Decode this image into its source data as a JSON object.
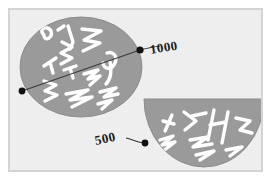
{
  "diagram": {
    "background_color": "#eeeeee",
    "frame_border_color": "#d4d4d4",
    "shape_fill_color": "#9a9a9a",
    "shape_stroke_color": "#8a8a8a",
    "scribble_color": "#ffffff",
    "marker_color": "#111111",
    "leader_line_color": "#333333",
    "shapes": [
      {
        "name": "ellipse-upper-left",
        "kind": "ellipse",
        "cx": 81,
        "cy": 67,
        "rx": 61,
        "ry": 50
      },
      {
        "name": "half-ellipse-lower-right",
        "kind": "half-ellipse",
        "cx": 204,
        "cy": 99,
        "rx": 60,
        "ry": 68
      }
    ],
    "chord": {
      "name": "chord-line",
      "x1": 22,
      "y1": 91,
      "x2": 140,
      "y2": 50
    },
    "markers": [
      {
        "name": "marker-left",
        "cx": 22,
        "cy": 91,
        "r": 3.4
      },
      {
        "name": "marker-top-right",
        "cx": 140,
        "cy": 50,
        "r": 3.6
      },
      {
        "name": "marker-lower",
        "cx": 145,
        "cy": 143,
        "r": 3.4
      }
    ],
    "annotations": [
      {
        "name": "annotation-1000",
        "label": "1000",
        "marker": "marker-top-right",
        "rotation_deg": -9
      },
      {
        "name": "annotation-500",
        "label": "500",
        "marker": "marker-lower",
        "rotation_deg": -12
      }
    ]
  }
}
